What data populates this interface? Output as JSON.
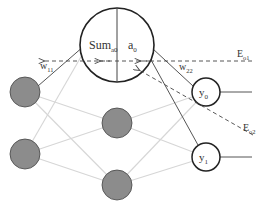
{
  "diagram": {
    "type": "neural-network-backpropagation",
    "colors": {
      "node_fill_gray": "#8c8c8c",
      "node_stroke_dark": "#222222",
      "connection_light": "#d4d4d4",
      "connection_dark": "#555555",
      "dashed": "#444444"
    },
    "nodes": {
      "hidden_detail": {
        "sum_label": "Sum",
        "sum_sub": "a0",
        "act_label": "a",
        "act_sub": "0"
      },
      "outputs": [
        {
          "label": "y",
          "sub": "0"
        },
        {
          "label": "y",
          "sub": "1"
        }
      ]
    },
    "weights": [
      {
        "label": "w",
        "sub": "11"
      },
      {
        "label": "w",
        "sub": "22"
      }
    ],
    "errors": [
      {
        "label": "E",
        "sub": "o1"
      },
      {
        "label": "E",
        "sub": "o2"
      }
    ]
  }
}
